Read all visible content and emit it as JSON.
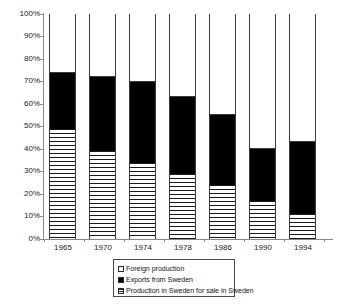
{
  "chart_data": {
    "type": "bar",
    "stacked": true,
    "stack_mode": "percent",
    "title": "",
    "subtitle": "",
    "xlabel": "",
    "ylabel": "",
    "categories": [
      "1965",
      "1970",
      "1974",
      "1978",
      "1986",
      "1990",
      "1994"
    ],
    "ylim": [
      0,
      100
    ],
    "yticks": [
      0,
      10,
      20,
      30,
      40,
      50,
      60,
      70,
      80,
      90,
      100
    ],
    "ytick_labels": [
      "0%",
      "10%",
      "20%",
      "30%",
      "40%",
      "50%",
      "60%",
      "70%",
      "80%",
      "90%",
      "100%"
    ],
    "grid": false,
    "legend_position": "bottom-center",
    "series": [
      {
        "name": "Production in Sweden for sale in Sweden",
        "fill": "horizontal-hatch",
        "values": [
          49,
          39,
          34,
          29,
          24,
          17,
          11
        ]
      },
      {
        "name": "Exports from Sweden",
        "fill": "solid-black",
        "values": [
          25,
          33,
          36,
          34,
          31,
          23,
          32
        ]
      },
      {
        "name": "Foreign production",
        "fill": "white",
        "values": [
          26,
          28,
          30,
          37,
          45,
          60,
          57
        ]
      }
    ],
    "cumulative_tops": {
      "domestic": [
        49,
        39,
        34,
        29,
        24,
        17,
        11
      ],
      "exports": [
        74,
        72,
        70,
        63,
        55,
        40,
        43
      ],
      "foreign": [
        100,
        100,
        100,
        100,
        100,
        100,
        100
      ]
    }
  },
  "axes": {
    "y_tick_labels": [
      "100%",
      "90%",
      "80%",
      "70%",
      "60%",
      "50%",
      "40%",
      "30%",
      "20%",
      "10%",
      "0%"
    ],
    "x_tick_labels": [
      "1965",
      "1970",
      "1974",
      "1978",
      "1986",
      "1990",
      "1994"
    ]
  },
  "legend": {
    "items": [
      {
        "label": "Foreign production",
        "swatch": "white-square-icon"
      },
      {
        "label": "Exports from Sweden",
        "swatch": "black-square-icon"
      },
      {
        "label": "Production in Sweden for sale in Sweden",
        "swatch": "hatched-square-icon"
      }
    ]
  },
  "colors": {
    "axis": "#8a8a8a",
    "bar_outline": "#3a3a3a",
    "exports": "#000000",
    "foreign": "#ffffff",
    "domestic_hatch": "#1a1a1a",
    "background": "#ffffff"
  }
}
